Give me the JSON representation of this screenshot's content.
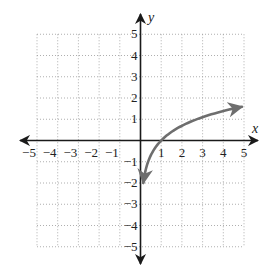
{
  "chart_data": {
    "type": "line",
    "title": "",
    "xlabel": "x",
    "ylabel": "y",
    "xlim": [
      -5,
      5
    ],
    "ylim": [
      -5,
      5
    ],
    "grid": true,
    "grid_style": "dotted",
    "x_ticks": [
      -5,
      -4,
      -3,
      -2,
      -1,
      1,
      2,
      3,
      4,
      5
    ],
    "y_ticks": [
      -5,
      -4,
      -3,
      -2,
      -1,
      1,
      2,
      3,
      4,
      5
    ],
    "x_tick_labels": [
      "−5",
      "−4",
      "−3",
      "−2",
      "−1",
      "1",
      "2",
      "3",
      "4",
      "5"
    ],
    "y_tick_labels": [
      "−5",
      "−4",
      "−3",
      "−2",
      "−1",
      "1",
      "2",
      "3",
      "4",
      "5"
    ],
    "series": [
      {
        "name": "y = ln(x)",
        "color": "#6e6e6e",
        "arrows_both_ends": true,
        "x": [
          0.135,
          0.2,
          0.3,
          0.5,
          0.75,
          1,
          1.5,
          2,
          2.5,
          3,
          3.5,
          4,
          4.5,
          4.9
        ],
        "y": [
          -2.0,
          -1.61,
          -1.2,
          -0.69,
          -0.29,
          0,
          0.41,
          0.69,
          0.92,
          1.1,
          1.25,
          1.39,
          1.5,
          1.59
        ]
      }
    ],
    "legend": null
  },
  "labels": {
    "x_axis": "x",
    "y_axis": "y"
  },
  "colors": {
    "axis": "#1a1a1a",
    "grid": "#9a9a9a",
    "curve": "#6e6e6e"
  }
}
